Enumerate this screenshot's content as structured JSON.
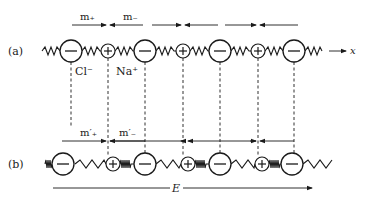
{
  "diagram": {
    "row_a": {
      "label": "(a)",
      "axis_label": "x",
      "ions": [
        {
          "type": "anion",
          "sign": "−",
          "x": 71
        },
        {
          "type": "cation",
          "sign": "+",
          "x": 108
        },
        {
          "type": "anion",
          "sign": "−",
          "x": 145
        },
        {
          "type": "cation",
          "sign": "+",
          "x": 183
        },
        {
          "type": "anion",
          "sign": "−",
          "x": 220
        },
        {
          "type": "cation",
          "sign": "+",
          "x": 258
        },
        {
          "type": "anion",
          "sign": "−",
          "x": 294
        }
      ],
      "ion_labels": {
        "anion": "Cl⁻",
        "cation": "Na⁺"
      },
      "force_labels": {
        "plus": "m₊",
        "minus": "m₋"
      }
    },
    "row_b": {
      "label": "(b)",
      "field_label": "E",
      "ions": [
        {
          "type": "anion",
          "sign": "−",
          "x": 63
        },
        {
          "type": "cation",
          "sign": "+",
          "x": 113
        },
        {
          "type": "anion",
          "sign": "−",
          "x": 145
        },
        {
          "type": "cation",
          "sign": "+",
          "x": 188
        },
        {
          "type": "anion",
          "sign": "−",
          "x": 220
        },
        {
          "type": "cation",
          "sign": "+",
          "x": 262
        },
        {
          "type": "anion",
          "sign": "−",
          "x": 292
        }
      ],
      "force_labels": {
        "plus": "m′₊",
        "minus": "m′₋"
      }
    },
    "colors": {
      "stroke": "#1a1a1a",
      "background": "#ffffff"
    }
  }
}
